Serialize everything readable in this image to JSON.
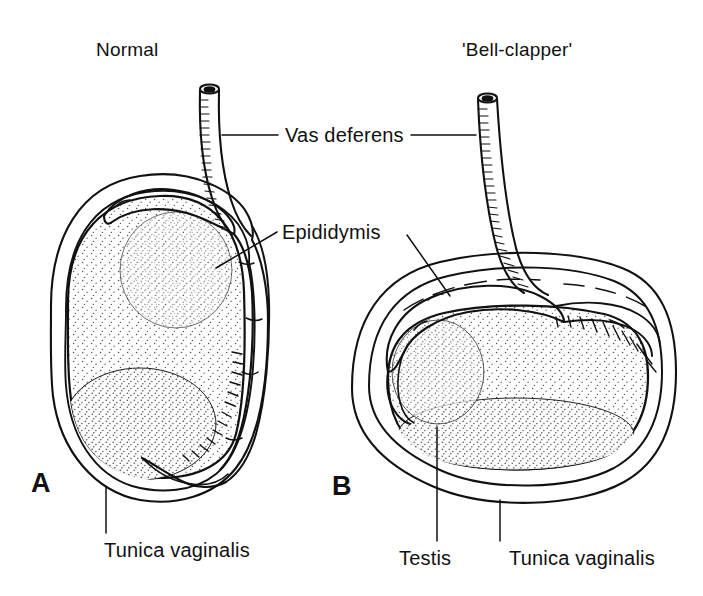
{
  "figure": {
    "background_color": "#ffffff",
    "ink_color": "#111111",
    "panels": [
      {
        "letter": "A",
        "title": "Normal",
        "structures": [
          "Tunica vaginalis",
          "Testis",
          "Epididymis",
          "Vas deferens"
        ]
      },
      {
        "letter": "B",
        "title": "'Bell-clapper'",
        "structures": [
          "Tunica vaginalis",
          "Testis",
          "Epididymis",
          "Vas deferens"
        ]
      }
    ],
    "labels": {
      "vas_deferens": "Vas deferens",
      "epididymis": "Epididymis",
      "tunica_vaginalis_a": "Tunica vaginalis",
      "testis": "Testis",
      "tunica_vaginalis_b": "Tunica vaginalis"
    }
  }
}
